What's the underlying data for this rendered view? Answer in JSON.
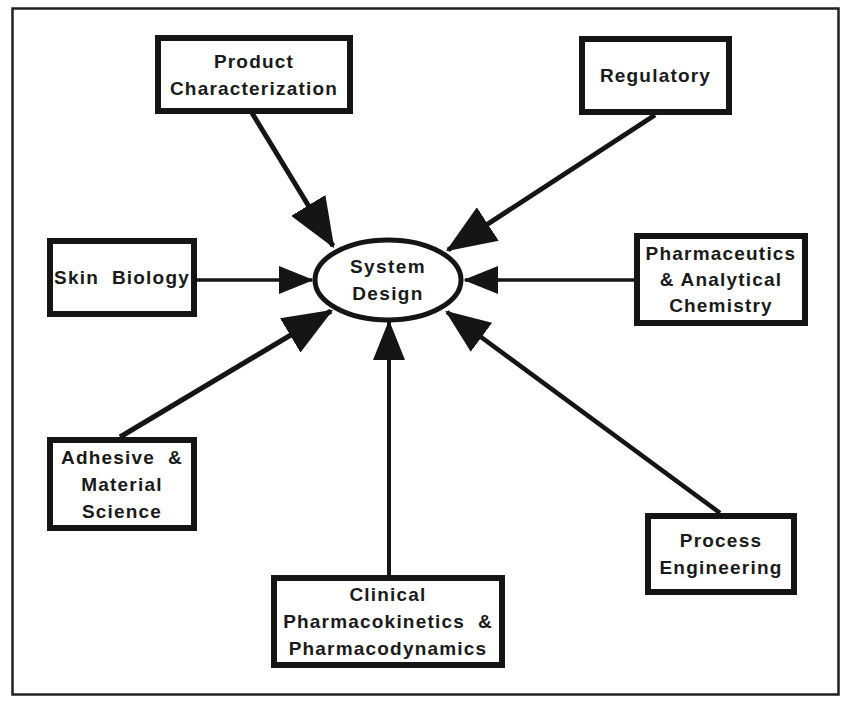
{
  "diagram": {
    "center": {
      "label_lines": [
        "System",
        "Design"
      ],
      "shape": "ellipse"
    },
    "nodes": [
      {
        "id": "product-characterization",
        "label_lines": [
          "Product",
          "Characterization"
        ]
      },
      {
        "id": "regulatory",
        "label_lines": [
          "Regulatory"
        ]
      },
      {
        "id": "skin-biology",
        "label_lines": [
          "Skin  Biology"
        ]
      },
      {
        "id": "pharmaceutics",
        "label_lines": [
          "Pharmaceutics",
          "& Analytical",
          "Chemistry"
        ]
      },
      {
        "id": "adhesive-material-science",
        "label_lines": [
          "Adhesive  &",
          "Material",
          "Science"
        ]
      },
      {
        "id": "clinical-pharmacokinetics",
        "label_lines": [
          "Clinical",
          "Pharmacokinetics  &",
          "Pharmacodynamics"
        ]
      },
      {
        "id": "process-engineering",
        "label_lines": [
          "Process",
          "Engineering"
        ]
      }
    ],
    "edges": [
      {
        "from": "product-characterization",
        "to": "system-design",
        "arrow": "end"
      },
      {
        "from": "regulatory",
        "to": "system-design",
        "arrow": "end"
      },
      {
        "from": "skin-biology",
        "to": "system-design",
        "arrow": "end"
      },
      {
        "from": "pharmaceutics",
        "to": "system-design",
        "arrow": "end"
      },
      {
        "from": "adhesive-material-science",
        "to": "system-design",
        "arrow": "end"
      },
      {
        "from": "clinical-pharmacokinetics",
        "to": "system-design",
        "arrow": "end"
      },
      {
        "from": "process-engineering",
        "to": "system-design",
        "arrow": "end"
      }
    ],
    "colors": {
      "stroke": "#151515",
      "background": "#ffffff",
      "text": "#1a1a1a"
    }
  }
}
